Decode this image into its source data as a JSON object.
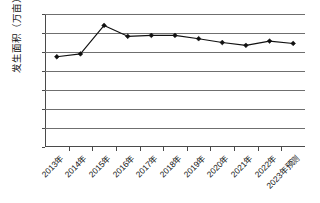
{
  "chart_data": {
    "type": "line",
    "title": "",
    "xlabel": "",
    "ylabel": "发生面积（万亩）",
    "ylim": [
      0,
      14
    ],
    "ytick_step": 2,
    "yticks": [
      "14",
      "12",
      "10",
      "8",
      "6",
      "4",
      "2",
      "0"
    ],
    "grid": true,
    "legend": "none",
    "marker": "diamond",
    "line_color": "#111111",
    "categories": [
      "2013年",
      "2014年",
      "2015年",
      "2016年",
      "2017年",
      "2018年",
      "2019年",
      "2020年",
      "2021年",
      "2022年",
      "2023年预测"
    ],
    "values": [
      9.5,
      9.8,
      12.8,
      11.65,
      11.75,
      11.75,
      11.4,
      11.0,
      10.7,
      11.15,
      10.9
    ],
    "series": [
      {
        "name": "发生面积",
        "values": [
          9.5,
          9.8,
          12.8,
          11.65,
          11.75,
          11.75,
          11.4,
          11.0,
          10.7,
          11.15,
          10.9
        ]
      }
    ]
  }
}
